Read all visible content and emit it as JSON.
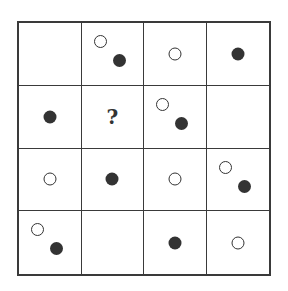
{
  "puzzle": {
    "rows": 4,
    "cols": 4,
    "question_mark": "?",
    "cells": [
      [
        {
          "shapes": []
        },
        {
          "shapes": [
            {
              "type": "open",
              "pos": "tl"
            },
            {
              "type": "filled",
              "pos": "br"
            }
          ]
        },
        {
          "shapes": [
            {
              "type": "open",
              "pos": "center"
            }
          ]
        },
        {
          "shapes": [
            {
              "type": "filled",
              "pos": "center"
            }
          ]
        }
      ],
      [
        {
          "shapes": [
            {
              "type": "filled",
              "pos": "center"
            }
          ]
        },
        {
          "shapes": [],
          "label": "?"
        },
        {
          "shapes": [
            {
              "type": "open",
              "pos": "tl"
            },
            {
              "type": "filled",
              "pos": "br"
            }
          ]
        },
        {
          "shapes": []
        }
      ],
      [
        {
          "shapes": [
            {
              "type": "open",
              "pos": "center"
            }
          ]
        },
        {
          "shapes": [
            {
              "type": "filled",
              "pos": "center"
            }
          ]
        },
        {
          "shapes": [
            {
              "type": "open",
              "pos": "center"
            }
          ]
        },
        {
          "shapes": [
            {
              "type": "open",
              "pos": "tl"
            },
            {
              "type": "filled",
              "pos": "br"
            }
          ]
        }
      ],
      [
        {
          "shapes": [
            {
              "type": "open",
              "pos": "tl"
            },
            {
              "type": "filled",
              "pos": "br"
            }
          ]
        },
        {
          "shapes": []
        },
        {
          "shapes": [
            {
              "type": "filled",
              "pos": "center"
            }
          ]
        },
        {
          "shapes": [
            {
              "type": "open",
              "pos": "center"
            }
          ]
        }
      ]
    ]
  },
  "colors": {
    "line": "#3a3a3a",
    "filled_dot": "#333333",
    "background": "#ffffff"
  }
}
